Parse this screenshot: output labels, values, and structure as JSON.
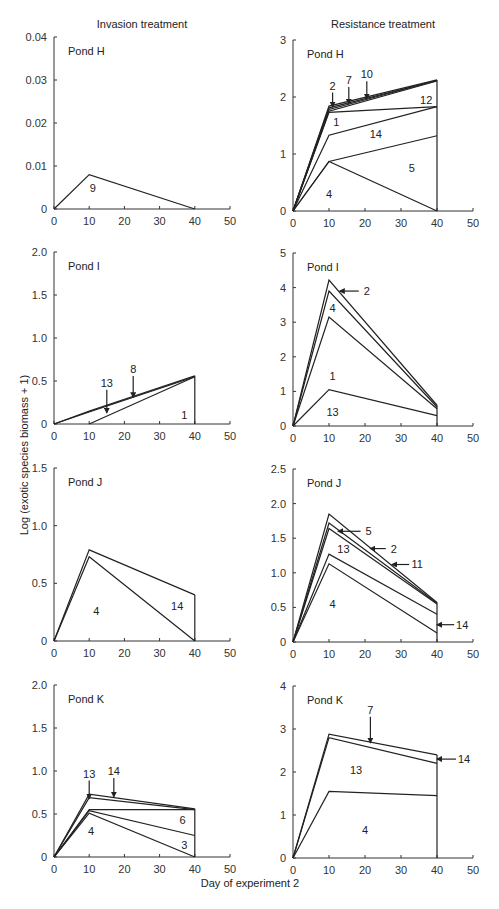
{
  "figure": {
    "column_titles": [
      "Invasion treatment",
      "Resistance treatment"
    ],
    "ylabel": "Log (exotic species biomass + 1)",
    "xlabel": "Day of experiment 2"
  },
  "chart_data": [
    {
      "type": "line",
      "id": "invasion-H",
      "column": 0,
      "row": 0,
      "title": "Invasion treatment",
      "panel_label": "Pond H",
      "xlabel": "Day of experiment 2",
      "ylabel": "Log (exotic species biomass + 1)",
      "xlim": [
        0,
        50
      ],
      "ylim": [
        0,
        0.04
      ],
      "xticks": [
        0,
        10,
        20,
        30,
        40,
        50
      ],
      "yticks": [
        "0",
        "0.01",
        "0.02",
        "0.03",
        "0.04"
      ],
      "x": [
        0,
        10,
        40
      ],
      "series": [
        {
          "name": "9",
          "values": [
            0,
            0.008,
            0
          ]
        }
      ],
      "annotations": [
        {
          "text": "9",
          "x": 11,
          "y": 0.005
        }
      ],
      "right_edge": true,
      "grid": false
    },
    {
      "type": "line",
      "id": "resistance-H",
      "column": 1,
      "row": 0,
      "title": "Resistance treatment",
      "panel_label": "Pond H",
      "xlim": [
        0,
        50
      ],
      "ylim": [
        0,
        3
      ],
      "xticks": [
        0,
        10,
        20,
        30,
        40,
        50
      ],
      "yticks": [
        "0",
        "1",
        "2",
        "3"
      ],
      "x": [
        0,
        10,
        40
      ],
      "series": [
        {
          "name": "4",
          "values": [
            0,
            0.87,
            0
          ]
        },
        {
          "name": "5",
          "values": [
            0,
            0.87,
            1.32
          ]
        },
        {
          "name": "14",
          "values": [
            0,
            1.33,
            1.83
          ]
        },
        {
          "name": "1",
          "values": [
            0,
            1.73,
            1.83
          ]
        },
        {
          "name": "12",
          "values": [
            0,
            1.75,
            2.28
          ]
        },
        {
          "name": "2",
          "values": [
            0,
            1.78,
            2.29
          ]
        },
        {
          "name": "7",
          "values": [
            0,
            1.81,
            2.29
          ]
        },
        {
          "name": "10",
          "values": [
            0,
            1.84,
            2.3
          ]
        }
      ],
      "annotations": [
        {
          "text": "4",
          "x": 10,
          "y": 0.3
        },
        {
          "text": "5",
          "x": 33,
          "y": 0.75
        },
        {
          "text": "14",
          "x": 23,
          "y": 1.35
        },
        {
          "text": "1",
          "x": 12,
          "y": 1.57
        },
        {
          "text": "12",
          "x": 37,
          "y": 1.95
        },
        {
          "text": "2",
          "x": 11,
          "y": 2.2,
          "arrow_to": [
            11,
            1.83
          ]
        },
        {
          "text": "7",
          "x": 15.5,
          "y": 2.3,
          "arrow_to": [
            15.5,
            1.88
          ]
        },
        {
          "text": "10",
          "x": 20.5,
          "y": 2.4,
          "arrow_to": [
            20.5,
            1.97
          ]
        }
      ],
      "right_edge": true,
      "grid": false
    },
    {
      "type": "line",
      "id": "invasion-I",
      "column": 0,
      "row": 1,
      "panel_label": "Pond I",
      "xlim": [
        0,
        50
      ],
      "ylim": [
        0,
        2.0
      ],
      "xticks": [
        0,
        10,
        20,
        30,
        40,
        50
      ],
      "yticks": [
        "0",
        "0.5",
        "1.0",
        "1.5",
        "2.0"
      ],
      "x": [
        0,
        10,
        40
      ],
      "series": [
        {
          "name": "1",
          "values": [
            null,
            0,
            0.55
          ]
        },
        {
          "name": "13",
          "values": [
            0,
            0.14,
            0.55
          ]
        },
        {
          "name": "8",
          "values": [
            0,
            0.15,
            0.56
          ]
        }
      ],
      "annotations": [
        {
          "text": "1",
          "x": 37,
          "y": 0.1
        },
        {
          "text": "13",
          "x": 15,
          "y": 0.48,
          "arrow_to": [
            15,
            0.13
          ]
        },
        {
          "text": "8",
          "x": 22.5,
          "y": 0.64,
          "arrow_to": [
            22.5,
            0.31
          ]
        }
      ],
      "right_edge": true,
      "grid": false
    },
    {
      "type": "line",
      "id": "resistance-I",
      "column": 1,
      "row": 1,
      "panel_label": "Pond I",
      "xlim": [
        0,
        50
      ],
      "ylim": [
        0,
        5
      ],
      "xticks": [
        0,
        10,
        20,
        30,
        40,
        50
      ],
      "yticks": [
        "0",
        "1",
        "2",
        "3",
        "4",
        "5"
      ],
      "x": [
        0,
        10,
        40
      ],
      "series": [
        {
          "name": "13",
          "values": [
            0,
            1.05,
            0.3
          ]
        },
        {
          "name": "1",
          "values": [
            0,
            3.15,
            0.5
          ]
        },
        {
          "name": "4",
          "values": [
            0,
            3.9,
            0.55
          ]
        },
        {
          "name": "2",
          "values": [
            0,
            4.22,
            0.6
          ]
        }
      ],
      "annotations": [
        {
          "text": "13",
          "x": 11,
          "y": 0.4
        },
        {
          "text": "1",
          "x": 11,
          "y": 1.45
        },
        {
          "text": "4",
          "x": 11,
          "y": 3.4
        },
        {
          "text": "2",
          "x": 20.5,
          "y": 3.9,
          "arrow_to": [
            13,
            3.9
          ]
        }
      ],
      "right_edge": true,
      "grid": false
    },
    {
      "type": "line",
      "id": "invasion-J",
      "column": 0,
      "row": 2,
      "panel_label": "Pond J",
      "xlim": [
        0,
        50
      ],
      "ylim": [
        0,
        1.5
      ],
      "xticks": [
        0,
        10,
        20,
        30,
        40,
        50
      ],
      "yticks": [
        "0",
        "0.5",
        "1.0",
        "1.5"
      ],
      "x": [
        0,
        10,
        40
      ],
      "series": [
        {
          "name": "4",
          "values": [
            0,
            0.73,
            0
          ]
        },
        {
          "name": "14",
          "values": [
            0,
            0.79,
            0.4
          ]
        }
      ],
      "annotations": [
        {
          "text": "4",
          "x": 12,
          "y": 0.26
        },
        {
          "text": "14",
          "x": 35,
          "y": 0.3
        }
      ],
      "right_edge": true,
      "grid": false
    },
    {
      "type": "line",
      "id": "resistance-J",
      "column": 1,
      "row": 2,
      "panel_label": "Pond J",
      "xlim": [
        0,
        50
      ],
      "ylim": [
        0,
        2.5
      ],
      "xticks": [
        0,
        10,
        20,
        30,
        40,
        50
      ],
      "yticks": [
        "0",
        "0.5",
        "1.0",
        "1.5",
        "2.0",
        "2.5"
      ],
      "x": [
        0,
        10,
        40
      ],
      "series": [
        {
          "name": "4",
          "values": [
            0,
            1.13,
            0.13
          ]
        },
        {
          "name": "13",
          "values": [
            0,
            1.27,
            0.4
          ]
        },
        {
          "name": "11",
          "values": [
            0,
            1.64,
            0.55
          ]
        },
        {
          "name": "5",
          "values": [
            0,
            1.72,
            0.56
          ]
        },
        {
          "name": "2",
          "values": [
            0,
            1.85,
            0.57
          ]
        },
        {
          "name": "14",
          "values": [
            null,
            null,
            0.25
          ]
        }
      ],
      "annotations": [
        {
          "text": "4",
          "x": 11,
          "y": 0.55
        },
        {
          "text": "13",
          "x": 14,
          "y": 1.35
        },
        {
          "text": "5",
          "x": 21,
          "y": 1.6,
          "arrow_to": [
            12.5,
            1.6
          ]
        },
        {
          "text": "2",
          "x": 28,
          "y": 1.35,
          "arrow_to": [
            21.5,
            1.35
          ]
        },
        {
          "text": "11",
          "x": 34.5,
          "y": 1.12,
          "arrow_to": [
            27.5,
            1.12
          ]
        },
        {
          "text": "14",
          "x": 47,
          "y": 0.25,
          "arrow_to": [
            40,
            0.25
          ]
        }
      ],
      "right_edge": true,
      "grid": false
    },
    {
      "type": "line",
      "id": "invasion-K",
      "column": 0,
      "row": 3,
      "panel_label": "Pond K",
      "xlim": [
        0,
        50
      ],
      "ylim": [
        0,
        2.0
      ],
      "xticks": [
        0,
        10,
        20,
        30,
        40,
        50
      ],
      "yticks": [
        "0",
        "0.5",
        "1.0",
        "1.5",
        "2.0"
      ],
      "x": [
        0,
        10,
        40
      ],
      "series": [
        {
          "name": "4",
          "values": [
            0,
            0.51,
            0
          ]
        },
        {
          "name": "3",
          "values": [
            0,
            0.54,
            0.25
          ]
        },
        {
          "name": "6",
          "values": [
            0,
            0.55,
            0.55
          ]
        },
        {
          "name": "13",
          "values": [
            0,
            0.69,
            0.55
          ]
        },
        {
          "name": "14",
          "values": [
            0,
            0.73,
            0.56
          ]
        }
      ],
      "annotations": [
        {
          "text": "4",
          "x": 10.5,
          "y": 0.3
        },
        {
          "text": "3",
          "x": 37,
          "y": 0.14
        },
        {
          "text": "6",
          "x": 36.5,
          "y": 0.43
        },
        {
          "text": "13",
          "x": 10,
          "y": 0.97,
          "arrow_to": [
            10,
            0.68
          ]
        },
        {
          "text": "14",
          "x": 17,
          "y": 1.0,
          "arrow_to": [
            17,
            0.7
          ]
        }
      ],
      "right_edge": true,
      "grid": false
    },
    {
      "type": "line",
      "id": "resistance-K",
      "column": 1,
      "row": 3,
      "panel_label": "Pond K",
      "xlim": [
        0,
        50
      ],
      "ylim": [
        0,
        4
      ],
      "xticks": [
        0,
        10,
        20,
        30,
        40,
        50
      ],
      "yticks": [
        "0",
        "1",
        "2",
        "3",
        "4"
      ],
      "x": [
        0,
        10,
        40
      ],
      "series": [
        {
          "name": "4",
          "values": [
            0,
            1.55,
            1.45
          ]
        },
        {
          "name": "13",
          "values": [
            0,
            2.8,
            2.2
          ]
        },
        {
          "name": "14",
          "values": [
            null,
            null,
            2.3
          ]
        },
        {
          "name": "7",
          "values": [
            0,
            2.88,
            2.4
          ]
        }
      ],
      "annotations": [
        {
          "text": "4",
          "x": 20,
          "y": 0.65
        },
        {
          "text": "13",
          "x": 17.5,
          "y": 2.05
        },
        {
          "text": "7",
          "x": 21.5,
          "y": 3.45,
          "arrow_to": [
            21.5,
            2.68
          ]
        },
        {
          "text": "14",
          "x": 47.5,
          "y": 2.3,
          "arrow_to": [
            40,
            2.3
          ]
        }
      ],
      "right_edge": true,
      "grid": false
    }
  ]
}
